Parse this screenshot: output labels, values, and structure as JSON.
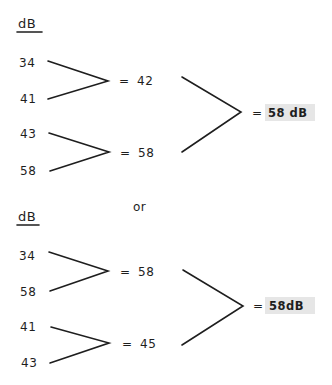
{
  "unit_heading": "dB",
  "separator": "or",
  "equals": "=",
  "arrangements": [
    {
      "pairs": [
        {
          "inputs": [
            "34",
            "41"
          ],
          "result": "42"
        },
        {
          "inputs": [
            "43",
            "58"
          ],
          "result": "58"
        }
      ],
      "final_result": "58 dB"
    },
    {
      "pairs": [
        {
          "inputs": [
            "34",
            "58"
          ],
          "result": "58"
        },
        {
          "inputs": [
            "41",
            "43"
          ],
          "result": "45"
        }
      ],
      "final_result": "58dB"
    }
  ],
  "highlight_color": "#e6e6e6",
  "ink_color": "#1e1e1e"
}
